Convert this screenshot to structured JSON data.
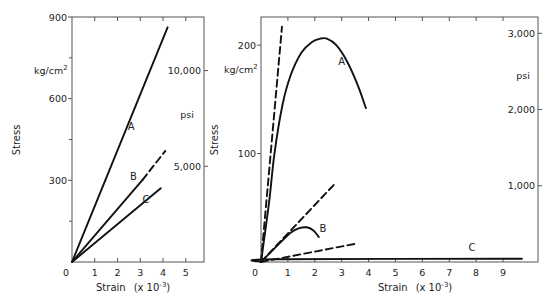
{
  "chart_data": [
    {
      "type": "line",
      "title": "",
      "xlabel": "Strain",
      "xlabel_suffix": "(x 10",
      "xlabel_exp": "-3",
      "xlabel_close": ")",
      "ylabel": "Stress",
      "y_unit_left": "kg/cm²",
      "y_unit_left_base": "kg/cm",
      "y_unit_left_sup": "2",
      "y_unit_right": "psi",
      "xlim": [
        0,
        5.8
      ],
      "ylim": [
        0,
        900
      ],
      "xticks": [
        0,
        1,
        2,
        3,
        4,
        5
      ],
      "xtick_labels": [
        "0",
        "1",
        "2",
        "3",
        "4",
        "5"
      ],
      "yticks_left": [
        300,
        600,
        900
      ],
      "ytick_labels_left": [
        "300",
        "600",
        "900"
      ],
      "yticks_right_psi": [
        5000,
        10000
      ],
      "ytick_labels_right": [
        "5,000",
        "10,000"
      ],
      "grid": false,
      "series": [
        {
          "name": "A",
          "style": "solid",
          "x": [
            0,
            4.2
          ],
          "y": [
            0,
            862
          ]
        },
        {
          "name": "B",
          "style": "solid",
          "x": [
            0,
            3.1
          ],
          "y": [
            0,
            302
          ]
        },
        {
          "name": "B-extension",
          "style": "dashed",
          "x": [
            3.1,
            4.1
          ],
          "y": [
            302,
            408
          ]
        },
        {
          "name": "C",
          "style": "solid",
          "x": [
            0,
            3.9
          ],
          "y": [
            0,
            271
          ]
        }
      ],
      "annotations": [
        {
          "text": "A",
          "x": 2.6,
          "y": 485
        },
        {
          "text": "B",
          "x": 2.7,
          "y": 300
        },
        {
          "text": "C",
          "x": 3.25,
          "y": 215
        }
      ]
    },
    {
      "type": "line",
      "title": "",
      "xlabel": "Strain",
      "xlabel_suffix": "(x 10",
      "xlabel_exp": "-3",
      "xlabel_close": ")",
      "ylabel": "Stress",
      "y_unit_left": "kg/cm²",
      "y_unit_left_base": "kg/cm",
      "y_unit_left_sup": "2",
      "y_unit_right": "psi",
      "xlim": [
        0,
        10.3
      ],
      "ylim": [
        0,
        226
      ],
      "xticks": [
        0,
        1,
        2,
        3,
        4,
        5,
        6,
        7,
        8,
        9
      ],
      "xtick_labels": [
        "0",
        "1",
        "2",
        "3",
        "4",
        "5",
        "6",
        "7",
        "8",
        "9"
      ],
      "yticks_left": [
        100,
        200
      ],
      "ytick_labels_left": [
        "100",
        "200"
      ],
      "yticks_right_psi": [
        1000,
        2000,
        3000
      ],
      "ytick_labels_right": [
        "1,000",
        "2,000",
        "3,000"
      ],
      "grid": false,
      "series": [
        {
          "name": "A",
          "style": "solid",
          "x": [
            0,
            0.3,
            0.5,
            0.8,
            1.1,
            1.5,
            1.9,
            2.2,
            2.45,
            2.8,
            3.2,
            3.6,
            3.9
          ],
          "y": [
            0,
            55,
            100,
            145,
            172,
            193,
            203,
            206,
            206,
            200,
            185,
            163,
            142
          ]
        },
        {
          "name": "A-tangent",
          "style": "dashed",
          "x": [
            0,
            0.78
          ],
          "y": [
            0,
            217
          ]
        },
        {
          "name": "B",
          "style": "solid",
          "x": [
            0,
            0.4,
            0.8,
            1.1,
            1.4,
            1.7,
            1.95,
            2.15
          ],
          "y": [
            0,
            10,
            20,
            27,
            31,
            32,
            29,
            23
          ]
        },
        {
          "name": "B-tangent",
          "style": "dashed",
          "x": [
            0,
            2.7
          ],
          "y": [
            0,
            71
          ]
        },
        {
          "name": "C",
          "style": "solid",
          "x": [
            0,
            0.5,
            9.7
          ],
          "y": [
            0,
            2.5,
            3
          ]
        },
        {
          "name": "C-tangent",
          "style": "dashed",
          "x": [
            0,
            3.55
          ],
          "y": [
            0,
            17
          ]
        }
      ],
      "annotations": [
        {
          "text": "A",
          "x": 3.0,
          "y": 182
        },
        {
          "text": "B",
          "x": 2.3,
          "y": 28
        },
        {
          "text": "C",
          "x": 7.85,
          "y": 10
        }
      ]
    }
  ],
  "left_chart": {
    "ylabel": "Stress",
    "xlabel": "Strain",
    "xunit": "(x 10",
    "xexp": "-3",
    "xclose": ")",
    "unit_kg": "kg/cm",
    "unit_kg_sup": "2",
    "unit_psi": "psi"
  },
  "right_chart": {
    "ylabel": "Stress",
    "xlabel": "Strain",
    "xunit": "(x 10",
    "xexp": "-3",
    "xclose": ")",
    "unit_kg": "kg/cm",
    "unit_kg_sup": "2",
    "unit_psi": "psi"
  }
}
